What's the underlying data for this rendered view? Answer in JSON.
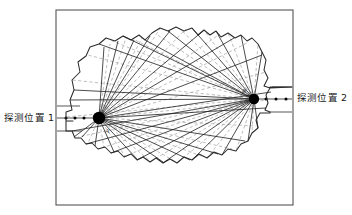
{
  "figure": {
    "type": "technical-diagram",
    "frame": {
      "x": 56,
      "y": 10,
      "width": 237,
      "height": 195,
      "stroke": "#555555",
      "stroke_width": 1.1
    },
    "colors": {
      "background": "#ffffff",
      "frame_stroke": "#555555",
      "outline_stroke": "#2b2b2b",
      "solid_ray": "#1f1f1f",
      "dashed_ray": "#9a9a9a",
      "node_fill": "#000000",
      "axis_line": "#3a3a3a",
      "label_text": "#1a1a1a"
    },
    "labels": {
      "left_detector": "探测位置 1",
      "right_detector": "探测位置 2",
      "node_a": "A",
      "node_b": "B"
    },
    "nodes": [
      {
        "id": "A",
        "label": "A",
        "cx": 99,
        "cy": 118,
        "r": 6.2,
        "label_dx": 6,
        "label_dy": 15
      },
      {
        "id": "B",
        "label": "B",
        "cx": 254,
        "cy": 99,
        "r": 5.2,
        "label_dx": -12,
        "label_dy": -6
      }
    ],
    "detector_axes": [
      {
        "id": "left-axis",
        "label": "探测位置 1",
        "label_x": 4,
        "label_y": 121,
        "line": {
          "x1": 57,
          "y1": 118,
          "x2": 99,
          "y2": 118
        },
        "bracket_top": {
          "x1": 57,
          "y1": 106,
          "x2": 80,
          "y2": 106
        },
        "bracket_bottom": {
          "x1": 57,
          "y1": 131,
          "x2": 82,
          "y2": 131
        },
        "tick_dots": [
          66,
          75,
          84
        ]
      },
      {
        "id": "right-axis",
        "label": "探测位置 2",
        "label_x": 297,
        "label_y": 101,
        "line": {
          "x1": 254,
          "y1": 99,
          "x2": 292,
          "y2": 99
        },
        "bracket_top": {
          "x1": 272,
          "y1": 87,
          "x2": 292,
          "y2": 87
        },
        "bracket_bottom": {
          "x1": 270,
          "y1": 112,
          "x2": 292,
          "y2": 112
        },
        "tick_dots": [
          266,
          276,
          286
        ]
      }
    ],
    "object_outline": "M 73 121 L 66 121 L 66 112 L 72 110 L 70 100 L 74 90 L 72 80 L 80 72 L 78 62 L 86 56 L 90 47 L 99 44 L 106 38 L 115 41 L 123 36 L 131 40 L 139 35 L 145 40 L 152 33 L 160 28 L 168 31 L 176 27 L 184 31 L 192 28 L 198 35 L 204 30 L 210 35 L 216 31 L 221 37 L 228 33 L 235 38 L 241 35 L 247 41 L 252 38 L 258 44 L 262 52 L 266 60 L 264 70 L 268 78 L 264 86 L 270 88 L 270 87 L 292 87 L 292 87 L 270 88 L 266 95 L 268 103 L 265 110 L 270 112 L 270 113 L 260 113 L 256 120 L 258 128 L 252 133 L 248 141 L 241 144 L 236 151 L 228 149 L 222 155 L 214 152 L 207 158 L 199 154 L 192 160 L 184 157 L 177 163 L 170 159 L 163 163 L 156 158 L 150 162 L 143 157 L 137 160 L 131 154 L 124 157 L 118 151 L 111 153 L 105 147 L 98 149 L 92 143 L 86 144 L 81 138 L 75 138 L 72 131 L 66 131 L 66 121 Z",
    "rays_solid_left": [
      {
        "x2": 104,
        "y2": 47
      },
      {
        "x2": 118,
        "y2": 41
      },
      {
        "x2": 134,
        "y2": 40
      },
      {
        "x2": 150,
        "y2": 36
      },
      {
        "x2": 170,
        "y2": 31
      },
      {
        "x2": 203,
        "y2": 31
      },
      {
        "x2": 234,
        "y2": 38
      },
      {
        "x2": 262,
        "y2": 55
      },
      {
        "x2": 271,
        "y2": 92
      },
      {
        "x2": 266,
        "y2": 108
      },
      {
        "x2": 245,
        "y2": 141
      },
      {
        "x2": 218,
        "y2": 154
      },
      {
        "x2": 190,
        "y2": 160
      },
      {
        "x2": 163,
        "y2": 162
      },
      {
        "x2": 137,
        "y2": 159
      },
      {
        "x2": 114,
        "y2": 152
      },
      {
        "x2": 95,
        "y2": 146
      },
      {
        "x2": 82,
        "y2": 137
      },
      {
        "x2": 74,
        "y2": 137
      }
    ],
    "rays_dashed_left": [
      {
        "x2": 110,
        "y2": 44
      },
      {
        "x2": 126,
        "y2": 38
      },
      {
        "x2": 142,
        "y2": 38
      },
      {
        "x2": 160,
        "y2": 29
      },
      {
        "x2": 186,
        "y2": 29
      },
      {
        "x2": 220,
        "y2": 34
      },
      {
        "x2": 249,
        "y2": 42
      },
      {
        "x2": 266,
        "y2": 72
      },
      {
        "x2": 268,
        "y2": 100
      },
      {
        "x2": 256,
        "y2": 126
      },
      {
        "x2": 232,
        "y2": 149
      },
      {
        "x2": 204,
        "y2": 157
      },
      {
        "x2": 176,
        "y2": 162
      },
      {
        "x2": 150,
        "y2": 161
      },
      {
        "x2": 125,
        "y2": 156
      },
      {
        "x2": 104,
        "y2": 148
      },
      {
        "x2": 88,
        "y2": 143
      }
    ],
    "rays_solid_right": [
      {
        "x2": 262,
        "y2": 52
      },
      {
        "x2": 241,
        "y2": 35
      },
      {
        "x2": 216,
        "y2": 31
      },
      {
        "x2": 192,
        "y2": 28
      },
      {
        "x2": 168,
        "y2": 31
      },
      {
        "x2": 145,
        "y2": 40
      },
      {
        "x2": 123,
        "y2": 36
      },
      {
        "x2": 99,
        "y2": 44
      },
      {
        "x2": 74,
        "y2": 90
      },
      {
        "x2": 70,
        "y2": 100
      },
      {
        "x2": 72,
        "y2": 131
      },
      {
        "x2": 86,
        "y2": 144
      },
      {
        "x2": 111,
        "y2": 153
      },
      {
        "x2": 137,
        "y2": 160
      },
      {
        "x2": 163,
        "y2": 163
      },
      {
        "x2": 192,
        "y2": 160
      },
      {
        "x2": 222,
        "y2": 155
      },
      {
        "x2": 248,
        "y2": 141
      },
      {
        "x2": 258,
        "y2": 128
      }
    ],
    "rays_dashed_right": [
      {
        "x2": 258,
        "y2": 44
      },
      {
        "x2": 228,
        "y2": 33
      },
      {
        "x2": 204,
        "y2": 30
      },
      {
        "x2": 180,
        "y2": 29
      },
      {
        "x2": 156,
        "y2": 34
      },
      {
        "x2": 133,
        "y2": 39
      },
      {
        "x2": 110,
        "y2": 40
      },
      {
        "x2": 88,
        "y2": 55
      },
      {
        "x2": 72,
        "y2": 80
      },
      {
        "x2": 66,
        "y2": 117
      },
      {
        "x2": 78,
        "y2": 137
      },
      {
        "x2": 98,
        "y2": 149
      },
      {
        "x2": 124,
        "y2": 157
      },
      {
        "x2": 150,
        "y2": 162
      },
      {
        "x2": 177,
        "y2": 163
      },
      {
        "x2": 207,
        "y2": 158
      },
      {
        "x2": 236,
        "y2": 151
      },
      {
        "x2": 252,
        "y2": 133
      }
    ]
  }
}
